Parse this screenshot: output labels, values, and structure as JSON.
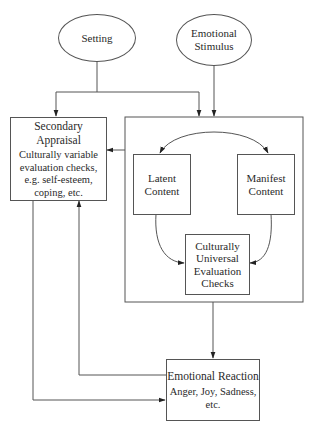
{
  "diagram": {
    "nodes": {
      "setting": {
        "label": "Setting"
      },
      "emotional_stimulus": {
        "label_line1": "Emotional",
        "label_line2": "Stimulus"
      },
      "secondary_appraisal": {
        "title": "Secondary Appraisal",
        "desc_line1": "Culturally variable",
        "desc_line2": "evaluation checks,",
        "desc_line3": "e.g. self-esteem,",
        "desc_line4": "coping, etc."
      },
      "latent_content": {
        "label_line1": "Latent",
        "label_line2": "Content"
      },
      "manifest_content": {
        "label_line1": "Manifest",
        "label_line2": "Content"
      },
      "universal_checks": {
        "label_line1": "Culturally",
        "label_line2": "Universal",
        "label_line3": "Evaluation",
        "label_line4": "Checks"
      },
      "emotional_reaction": {
        "title": "Emotional Reaction",
        "desc_line1": "Anger, Joy, Sadness,",
        "desc_line2": "etc."
      }
    },
    "edges": [
      {
        "from": "setting",
        "to": "secondary_appraisal"
      },
      {
        "from": "setting",
        "to": "primary_appraisal_group"
      },
      {
        "from": "emotional_stimulus",
        "to": "primary_appraisal_group"
      },
      {
        "from": "latent_content",
        "to": "manifest_content",
        "bidirectional": true
      },
      {
        "from": "latent_content",
        "to": "universal_checks"
      },
      {
        "from": "manifest_content",
        "to": "universal_checks"
      },
      {
        "from": "primary_appraisal_group",
        "to": "secondary_appraisal"
      },
      {
        "from": "primary_appraisal_group",
        "to": "emotional_reaction"
      },
      {
        "from": "emotional_reaction",
        "to": "secondary_appraisal"
      },
      {
        "from": "secondary_appraisal",
        "to": "emotional_reaction"
      }
    ],
    "colors": {
      "line": "#555555",
      "text": "#2a2a2a",
      "background": "#ffffff"
    }
  }
}
